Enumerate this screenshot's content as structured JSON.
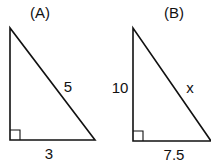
{
  "figures": [
    {
      "label": "(A)",
      "hypotenuse_label": "5",
      "base_label": "3",
      "height_label": ""
    },
    {
      "label": "(B)",
      "hypotenuse_label": "x",
      "base_label": "7.5",
      "height_label": "10"
    }
  ],
  "colors": {
    "stroke": "#111111",
    "background": "#ffffff"
  }
}
